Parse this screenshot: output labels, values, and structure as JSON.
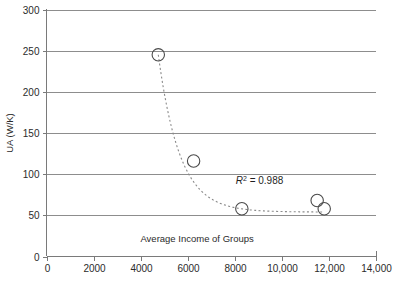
{
  "chart_data": {
    "type": "scatter",
    "title": "",
    "xlabel": "Average Income of Groups",
    "ylabel": "UA (W/K)",
    "xlim": [
      0,
      14000
    ],
    "ylim": [
      0,
      300
    ],
    "grid": "horizontal",
    "legend": "none",
    "marker_style": "open-circle",
    "trend_style": "dotted",
    "x": [
      4750,
      6250,
      8300,
      11500,
      11800
    ],
    "values": [
      245,
      116,
      58,
      68,
      58
    ],
    "points": [
      {
        "x": 4750,
        "y": 245
      },
      {
        "x": 6250,
        "y": 116
      },
      {
        "x": 8300,
        "y": 58
      },
      {
        "x": 11500,
        "y": 68
      },
      {
        "x": 11800,
        "y": 58
      }
    ],
    "xticks": [
      0,
      2000,
      4000,
      6000,
      8000,
      10000,
      12000,
      14000
    ],
    "xtick_labels": [
      "0",
      "2000",
      "4000",
      "6000",
      "8000",
      "10,000",
      "12,000",
      "14,000"
    ],
    "yticks": [
      0,
      50,
      100,
      150,
      200,
      250,
      300
    ],
    "ytick_labels": [
      "0",
      "50",
      "100",
      "150",
      "200",
      "250",
      "300"
    ],
    "annotations": [
      {
        "name": "r-squared",
        "symbol": "R",
        "exponent": "2",
        "equals": " = 0.988",
        "full_text": "R2 = 0.988",
        "x": 9050,
        "y": 88
      }
    ],
    "colors": {
      "grid": "#8d8d8d",
      "axis": "#7a7a7a",
      "marker": "#4a4a4a",
      "trend": "#8a8a8a",
      "text": "#2b2b2b",
      "background": "#ffffff"
    }
  }
}
